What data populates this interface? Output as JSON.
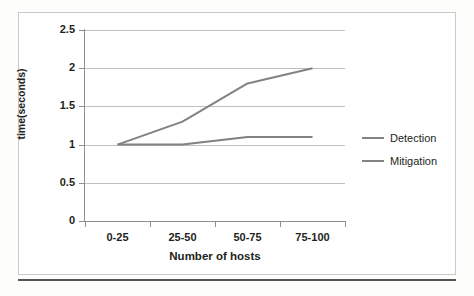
{
  "chart_data": {
    "type": "line",
    "title": "",
    "xlabel": "Number of hosts",
    "ylabel": "time(seconds)",
    "categories": [
      "0-25",
      "25-50",
      "50-75",
      "75-100"
    ],
    "series": [
      {
        "name": "Detection",
        "values": [
          1.0,
          1.3,
          1.8,
          2.0
        ],
        "color": "#808285"
      },
      {
        "name": "Mitigation",
        "values": [
          1.0,
          1.0,
          1.1,
          1.1
        ],
        "color": "#808285"
      }
    ],
    "ylim": [
      0,
      2.5
    ],
    "ytick_labels": [
      "2.5",
      "2",
      "1.5",
      "1",
      "0.5",
      "0"
    ],
    "ytick_values": [
      2.5,
      2,
      1.5,
      1,
      0.5,
      0
    ],
    "grid": true,
    "legend_position": "right",
    "legend_entries": [
      "Detection",
      "Mitigation"
    ]
  },
  "axes": {
    "y_title": "time(seconds)",
    "x_title": "Number of hosts"
  },
  "colors": {
    "line": "#808285",
    "gridline": "#bfbfbf",
    "axis": "#8f8f8f",
    "frame": "#c9c9c9",
    "text": "#231f20",
    "rule": "#555555"
  }
}
